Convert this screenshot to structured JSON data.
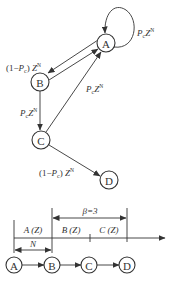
{
  "state_diagram": {
    "nodes": [
      {
        "id": "A",
        "label": "A",
        "cx": 106,
        "cy": 43
      },
      {
        "id": "B",
        "label": "B",
        "cx": 40,
        "cy": 82
      },
      {
        "id": "C",
        "label": "C",
        "cx": 41,
        "cy": 140
      },
      {
        "id": "D",
        "label": "D",
        "cx": 109,
        "cy": 180
      }
    ],
    "edges": [
      {
        "from": "A",
        "to": "A",
        "label": "P_c Z^N",
        "label_parts": {
          "p": "P",
          "sub": "c",
          "z": "Z",
          "sup": "N",
          "prefix": "",
          "suffix": ""
        }
      },
      {
        "from": "A",
        "to": "B",
        "label": "(1-P_c) Z^N",
        "label_parts": {
          "prefix": "(1−",
          "p": "P",
          "sub": "c",
          "suffix": ")",
          "z": "Z",
          "sup": "N"
        }
      },
      {
        "from": "B",
        "to": "A",
        "label": ""
      },
      {
        "from": "B",
        "to": "C",
        "label": "P_c Z^N",
        "label_parts": {
          "p": "P",
          "sub": "c",
          "z": "Z",
          "sup": "N"
        }
      },
      {
        "from": "C",
        "to": "A",
        "label": "P_c Z^N",
        "label_parts": {
          "p": "P",
          "sub": "c",
          "z": "Z",
          "sup": "N"
        }
      },
      {
        "from": "C",
        "to": "D",
        "label": "(1-P_c) Z^N",
        "label_parts": {
          "prefix": "(1−",
          "p": "P",
          "sub": "c",
          "suffix": ")",
          "z": "Z",
          "sup": "N"
        }
      }
    ]
  },
  "timeline": {
    "beta_label": "β=3",
    "n_label": "N",
    "segments": [
      "A (Z)",
      "B (Z)",
      "C (Z)"
    ],
    "chain_nodes": [
      "A",
      "B",
      "C",
      "D"
    ]
  }
}
